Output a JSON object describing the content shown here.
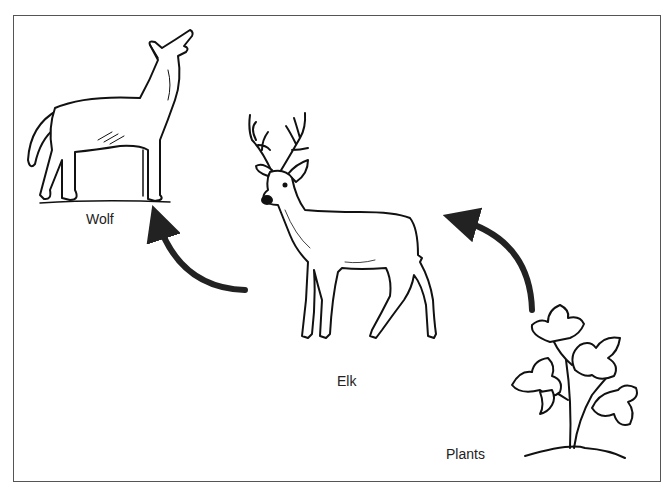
{
  "diagram": {
    "type": "food-chain",
    "organisms": [
      {
        "id": "wolf",
        "label": "Wolf",
        "role": "predator"
      },
      {
        "id": "elk",
        "label": "Elk",
        "role": "herbivore"
      },
      {
        "id": "plants",
        "label": "Plants",
        "role": "producer"
      }
    ],
    "arrows": [
      {
        "from": "plants",
        "to": "elk"
      },
      {
        "from": "elk",
        "to": "wolf"
      }
    ]
  },
  "colors": {
    "line": "#111111",
    "arrow": "#222222",
    "frame": "#555555",
    "background": "#ffffff"
  }
}
